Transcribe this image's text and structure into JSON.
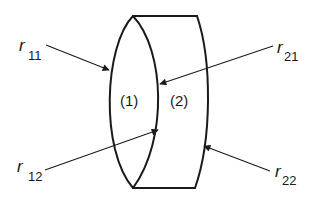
{
  "diagram": {
    "type": "compound-lens-cross-section",
    "elements": [
      {
        "id": "1",
        "label": "(1)",
        "shape": "biconvex lens"
      },
      {
        "id": "2",
        "label": "(2)",
        "shape": "concave-convex (meniscus-like) lens"
      }
    ],
    "surfaces": [
      {
        "id": "r11",
        "symbol": "r",
        "subscript": "11",
        "description": "left surface of element 1"
      },
      {
        "id": "r12",
        "symbol": "r",
        "subscript": "12",
        "description": "right surface of element 1"
      },
      {
        "id": "r21",
        "symbol": "r",
        "subscript": "21",
        "description": "left surface of element 2"
      },
      {
        "id": "r22",
        "symbol": "r",
        "subscript": "22",
        "description": "right surface of element 2"
      }
    ],
    "colors": {
      "line": "#1a1a1a",
      "background": "#ffffff"
    }
  }
}
